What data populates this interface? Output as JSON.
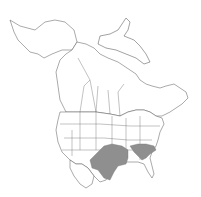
{
  "map": {
    "title": "",
    "region": "North America",
    "colors": {
      "background": "#ffffff",
      "land": "#ffffff",
      "outline": "#555555",
      "range": "#8f8f8f"
    },
    "range_areas": [
      {
        "name": "southern-plains-range",
        "description": "Texas, Oklahoma, Kansas, Arkansas"
      },
      {
        "name": "appalachian-range",
        "description": "Kentucky, Tennessee, Virginia area"
      }
    ]
  }
}
